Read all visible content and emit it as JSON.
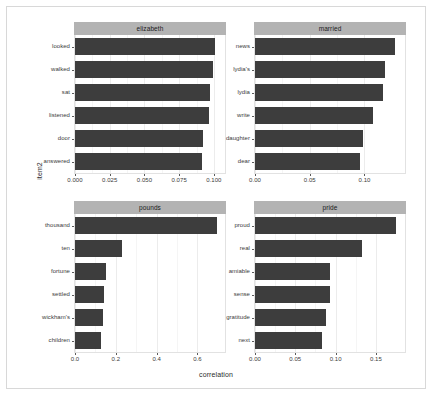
{
  "chart_data": {
    "type": "bar",
    "title": "",
    "subtitle": "",
    "xlabel": "correlation",
    "ylabel": "item2",
    "orientation": "horizontal",
    "grid": true,
    "legend": "none",
    "facet_layout": "2x2",
    "bar_color": "#3d3d3d",
    "strip_color": "#b3b3b3",
    "panels": [
      {
        "facet_label": "elizabeth",
        "xlim": [
          0,
          0.108
        ],
        "xticks": [
          "0.000",
          "0.025",
          "0.050",
          "0.075",
          "0.100"
        ],
        "xtick_values": [
          0.0,
          0.025,
          0.05,
          0.075,
          0.1
        ],
        "categories": [
          "looked",
          "walked",
          "sat",
          "listened",
          "door",
          "answered"
        ],
        "values": [
          0.1005,
          0.0995,
          0.0975,
          0.0965,
          0.0925,
          0.0915
        ]
      },
      {
        "facet_label": "married",
        "xlim": [
          0,
          0.137
        ],
        "xticks": [
          "0.00",
          "0.05",
          "0.10"
        ],
        "xtick_values": [
          0.0,
          0.05,
          0.1
        ],
        "categories": [
          "news",
          "lydia's",
          "lydia",
          "write",
          "daughter",
          "dear"
        ],
        "values": [
          0.1275,
          0.1185,
          0.1165,
          0.1075,
          0.0985,
          0.0955
        ]
      },
      {
        "facet_label": "pounds",
        "xlim": [
          0,
          0.735
        ],
        "xticks": [
          "0.0",
          "0.2",
          "0.4",
          "0.6"
        ],
        "xtick_values": [
          0.0,
          0.2,
          0.4,
          0.6
        ],
        "categories": [
          "thousand",
          "ten",
          "fortune",
          "settled",
          "wickham's",
          "children"
        ],
        "values": [
          0.695,
          0.232,
          0.153,
          0.143,
          0.138,
          0.128
        ]
      },
      {
        "facet_label": "pride",
        "xlim": [
          0,
          0.186
        ],
        "xticks": [
          "0.00",
          "0.05",
          "0.10",
          "0.15"
        ],
        "xtick_values": [
          0.0,
          0.05,
          0.1,
          0.15
        ],
        "categories": [
          "proud",
          "real",
          "amiable",
          "sense",
          "gratitude",
          "next"
        ],
        "values": [
          0.175,
          0.133,
          0.0935,
          0.0925,
          0.0885,
          0.0825
        ]
      }
    ]
  }
}
